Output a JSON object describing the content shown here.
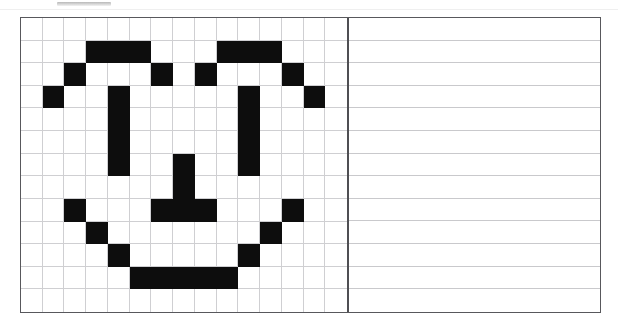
{
  "page": {
    "width": 618,
    "height": 331,
    "background_color": "#ffffff",
    "border_color": "#58585c",
    "grid_line_color": "#cfcfd2",
    "fill_color": "#0d0d0d",
    "divider_color": "#4f4f53"
  },
  "top_bar": {
    "present": true,
    "color": "#b8b8b8",
    "label": ""
  },
  "worksheet": {
    "title": "",
    "panels": [
      {
        "name": "pixel-grid-panel",
        "columns": 15,
        "rows": 13
      },
      {
        "name": "ruled-lines-panel",
        "columns": 1,
        "rows": 13
      }
    ]
  },
  "chart_data": {
    "type": "heatmap",
    "title": "",
    "subtitle": "",
    "xlabel": "",
    "ylabel": "",
    "columns": 15,
    "rows": 13,
    "legend": [],
    "annotations": [],
    "grid": true,
    "value_labels": {
      "0": "empty",
      "1": "filled"
    },
    "colors": {
      "0": "#ffffff",
      "1": "#0d0d0d"
    },
    "depicts": "pixel-art smiley face",
    "filled_cells_by_row": [
      [],
      [
        3,
        4,
        5,
        9,
        10,
        11
      ],
      [
        2,
        6,
        8,
        12
      ],
      [
        1,
        4,
        10,
        13
      ],
      [
        4,
        10
      ],
      [
        4,
        10
      ],
      [
        4,
        7,
        10
      ],
      [
        7
      ],
      [
        2,
        6,
        7,
        8,
        12
      ],
      [
        3,
        11
      ],
      [
        4,
        10
      ],
      [
        5,
        6,
        7,
        8,
        9
      ],
      []
    ],
    "values": [
      [
        0,
        0,
        0,
        0,
        0,
        0,
        0,
        0,
        0,
        0,
        0,
        0,
        0,
        0,
        0
      ],
      [
        0,
        0,
        0,
        1,
        1,
        1,
        0,
        0,
        0,
        1,
        1,
        1,
        0,
        0,
        0
      ],
      [
        0,
        0,
        1,
        0,
        0,
        0,
        1,
        0,
        1,
        0,
        0,
        0,
        1,
        0,
        0
      ],
      [
        0,
        1,
        0,
        0,
        1,
        0,
        0,
        0,
        0,
        0,
        1,
        0,
        0,
        1,
        0
      ],
      [
        0,
        0,
        0,
        0,
        1,
        0,
        0,
        0,
        0,
        0,
        1,
        0,
        0,
        0,
        0
      ],
      [
        0,
        0,
        0,
        0,
        1,
        0,
        0,
        0,
        0,
        0,
        1,
        0,
        0,
        0,
        0
      ],
      [
        0,
        0,
        0,
        0,
        1,
        0,
        0,
        1,
        0,
        0,
        1,
        0,
        0,
        0,
        0
      ],
      [
        0,
        0,
        0,
        0,
        0,
        0,
        0,
        1,
        0,
        0,
        0,
        0,
        0,
        0,
        0
      ],
      [
        0,
        0,
        1,
        0,
        0,
        0,
        1,
        1,
        1,
        0,
        0,
        0,
        1,
        0,
        0
      ],
      [
        0,
        0,
        0,
        1,
        0,
        0,
        0,
        0,
        0,
        0,
        0,
        1,
        0,
        0,
        0
      ],
      [
        0,
        0,
        0,
        0,
        1,
        0,
        0,
        0,
        0,
        0,
        1,
        0,
        0,
        0,
        0
      ],
      [
        0,
        0,
        0,
        0,
        0,
        1,
        1,
        1,
        1,
        1,
        0,
        0,
        0,
        0,
        0
      ],
      [
        0,
        0,
        0,
        0,
        0,
        0,
        0,
        0,
        0,
        0,
        0,
        0,
        0,
        0,
        0
      ]
    ],
    "ruled_panel_rows": 13
  }
}
